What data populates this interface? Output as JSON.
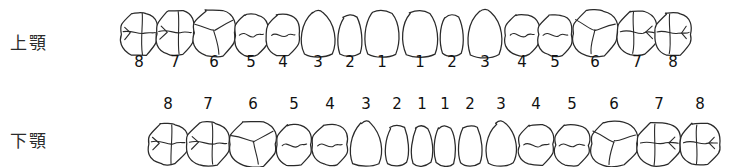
{
  "chart": {
    "upper": {
      "label": "上顎",
      "numbers": [
        "8",
        "7",
        "6",
        "5",
        "4",
        "3",
        "2",
        "1",
        "1",
        "2",
        "3",
        "4",
        "5",
        "6",
        "7",
        "8"
      ],
      "numbers_position": "below",
      "teeth": [
        {
          "number": "8",
          "side": "right",
          "type": "molar",
          "cx": 139,
          "cy": 34,
          "w": 35,
          "h": 41
        },
        {
          "number": "7",
          "side": "right",
          "type": "molar",
          "cx": 175,
          "cy": 33,
          "w": 37,
          "h": 43
        },
        {
          "number": "6",
          "side": "right",
          "type": "molar",
          "cx": 214,
          "cy": 33,
          "w": 41,
          "h": 45
        },
        {
          "number": "5",
          "side": "right",
          "type": "premolar",
          "cx": 251,
          "cy": 35,
          "w": 32,
          "h": 40
        },
        {
          "number": "4",
          "side": "right",
          "type": "premolar",
          "cx": 283,
          "cy": 35,
          "w": 32,
          "h": 40
        },
        {
          "number": "3",
          "side": "right",
          "type": "canine",
          "cx": 318,
          "cy": 34,
          "w": 36,
          "h": 46
        },
        {
          "number": "2",
          "side": "right",
          "type": "incisor",
          "cx": 350,
          "cy": 36,
          "w": 25,
          "h": 40
        },
        {
          "number": "1",
          "side": "right",
          "type": "incisor",
          "cx": 382,
          "cy": 34,
          "w": 37,
          "h": 45
        },
        {
          "number": "1",
          "side": "left",
          "type": "incisor",
          "cx": 420,
          "cy": 34,
          "w": 37,
          "h": 45
        },
        {
          "number": "2",
          "side": "left",
          "type": "incisor",
          "cx": 452,
          "cy": 36,
          "w": 25,
          "h": 40
        },
        {
          "number": "3",
          "side": "left",
          "type": "canine",
          "cx": 485,
          "cy": 34,
          "w": 37,
          "h": 47
        },
        {
          "number": "4",
          "side": "left",
          "type": "premolar",
          "cx": 522,
          "cy": 35,
          "w": 33,
          "h": 40
        },
        {
          "number": "5",
          "side": "left",
          "type": "premolar",
          "cx": 555,
          "cy": 35,
          "w": 33,
          "h": 40
        },
        {
          "number": "6",
          "side": "left",
          "type": "molar",
          "cx": 595,
          "cy": 33,
          "w": 43,
          "h": 45
        },
        {
          "number": "7",
          "side": "left",
          "type": "molar",
          "cx": 637,
          "cy": 33,
          "w": 38,
          "h": 43
        },
        {
          "number": "8",
          "side": "left",
          "type": "molar",
          "cx": 673,
          "cy": 34,
          "w": 35,
          "h": 41
        }
      ],
      "number_x": [
        139,
        175,
        214,
        251,
        283,
        318,
        350,
        382,
        420,
        452,
        485,
        522,
        555,
        595,
        637,
        673
      ],
      "number_y": 62
    },
    "lower": {
      "label": "下顎",
      "numbers": [
        "8",
        "7",
        "6",
        "5",
        "4",
        "3",
        "2",
        "1",
        "1",
        "2",
        "3",
        "4",
        "5",
        "6",
        "7",
        "8"
      ],
      "numbers_position": "above",
      "teeth": [
        {
          "number": "8",
          "side": "right",
          "type": "molar",
          "cx": 168,
          "cy": 144,
          "w": 38,
          "h": 40
        },
        {
          "number": "7",
          "side": "right",
          "type": "molar",
          "cx": 208,
          "cy": 144,
          "w": 42,
          "h": 42
        },
        {
          "number": "6",
          "side": "right",
          "type": "molar",
          "cx": 253,
          "cy": 144,
          "w": 46,
          "h": 43
        },
        {
          "number": "5",
          "side": "right",
          "type": "premolar",
          "cx": 294,
          "cy": 145,
          "w": 34,
          "h": 39
        },
        {
          "number": "4",
          "side": "right",
          "type": "premolar",
          "cx": 330,
          "cy": 145,
          "w": 34,
          "h": 39
        },
        {
          "number": "3",
          "side": "right",
          "type": "canine",
          "cx": 366,
          "cy": 144,
          "w": 33,
          "h": 44
        },
        {
          "number": "2",
          "side": "right",
          "type": "incisor",
          "cx": 397,
          "cy": 146,
          "w": 25,
          "h": 39
        },
        {
          "number": "1",
          "side": "right",
          "type": "incisor",
          "cx": 422,
          "cy": 146,
          "w": 22,
          "h": 39
        },
        {
          "number": "1",
          "side": "left",
          "type": "incisor",
          "cx": 445,
          "cy": 146,
          "w": 22,
          "h": 39
        },
        {
          "number": "2",
          "side": "left",
          "type": "incisor",
          "cx": 470,
          "cy": 146,
          "w": 25,
          "h": 39
        },
        {
          "number": "3",
          "side": "left",
          "type": "canine",
          "cx": 501,
          "cy": 144,
          "w": 33,
          "h": 44
        },
        {
          "number": "4",
          "side": "left",
          "type": "premolar",
          "cx": 536,
          "cy": 145,
          "w": 34,
          "h": 39
        },
        {
          "number": "5",
          "side": "left",
          "type": "premolar",
          "cx": 572,
          "cy": 145,
          "w": 34,
          "h": 39
        },
        {
          "number": "6",
          "side": "left",
          "type": "molar",
          "cx": 614,
          "cy": 144,
          "w": 46,
          "h": 43
        },
        {
          "number": "7",
          "side": "left",
          "type": "molar",
          "cx": 659,
          "cy": 144,
          "w": 42,
          "h": 42
        },
        {
          "number": "8",
          "side": "left",
          "type": "molar",
          "cx": 700,
          "cy": 144,
          "w": 38,
          "h": 40
        }
      ],
      "number_x": [
        168,
        208,
        253,
        294,
        330,
        366,
        397,
        422,
        445,
        470,
        501,
        536,
        572,
        614,
        659,
        700
      ],
      "number_y": 104
    },
    "colors": {
      "outline": "#2a2a2a",
      "text": "#111111",
      "background": "#ffffff"
    }
  }
}
